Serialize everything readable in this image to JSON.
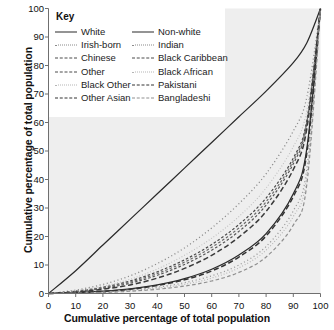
{
  "chart_data": {
    "type": "line",
    "title": "",
    "xlabel": "Cumulative percentage of total population",
    "ylabel": "Cumulative percentage of total population",
    "xlim": [
      0,
      100
    ],
    "ylim": [
      0,
      100
    ],
    "xticks": [
      0,
      10,
      20,
      30,
      40,
      50,
      60,
      70,
      80,
      90,
      100
    ],
    "yticks": [
      0,
      10,
      20,
      30,
      40,
      50,
      60,
      70,
      80,
      90,
      100
    ],
    "grid": false,
    "legend_position": "top-left",
    "legend_title": "Key",
    "x": [
      0,
      10,
      20,
      30,
      40,
      50,
      60,
      70,
      80,
      90,
      95,
      100
    ],
    "series": [
      {
        "name": "White",
        "style": "solid",
        "color": "#2a2a2a",
        "values": [
          0,
          8,
          17,
          26,
          35,
          44,
          53,
          62,
          71,
          81,
          88,
          100
        ]
      },
      {
        "name": "Non-white",
        "style": "solid",
        "color": "#2a2a2a",
        "values": [
          0,
          0.3,
          0.8,
          1.6,
          3.0,
          5.2,
          8.5,
          13.5,
          21.0,
          35.0,
          51.0,
          100
        ]
      },
      {
        "name": "Irish-born",
        "style": "dotted",
        "color": "#8a8a8a",
        "values": [
          0,
          1.2,
          3.2,
          6.2,
          10.5,
          16.0,
          23.0,
          31.5,
          42.0,
          57.0,
          69.0,
          100
        ]
      },
      {
        "name": "Indian",
        "style": "dotted",
        "color": "#9a9a9a",
        "values": [
          0,
          0.2,
          0.6,
          1.2,
          2.2,
          3.8,
          6.2,
          10.0,
          16.5,
          29.0,
          44.0,
          100
        ]
      },
      {
        "name": "Chinese",
        "style": "dash-short",
        "color": "#4a4a4a",
        "values": [
          0,
          0.8,
          2.2,
          4.4,
          7.6,
          11.8,
          17.2,
          24.2,
          33.5,
          47.5,
          61.0,
          100
        ]
      },
      {
        "name": "Black Caribbean",
        "style": "dash-short",
        "color": "#555555",
        "values": [
          0,
          0.6,
          1.8,
          3.6,
          6.4,
          10.2,
          15.2,
          21.8,
          31.0,
          45.5,
          59.5,
          100
        ]
      },
      {
        "name": "Other",
        "style": "dash-short",
        "color": "#6a6a6a",
        "values": [
          0,
          0.7,
          2.0,
          4.0,
          7.0,
          11.0,
          16.2,
          23.0,
          32.2,
          46.5,
          60.2,
          100
        ]
      },
      {
        "name": "Black African",
        "style": "fine-dot",
        "color": "#b0b0b0",
        "values": [
          0,
          0.15,
          0.5,
          1.0,
          1.9,
          3.2,
          5.4,
          9.0,
          15.2,
          27.0,
          41.5,
          100
        ]
      },
      {
        "name": "Black Other",
        "style": "fine-dot",
        "color": "#bdbdbd",
        "values": [
          0,
          0.9,
          2.6,
          5.0,
          8.6,
          13.4,
          19.4,
          27.0,
          37.0,
          51.5,
          64.5,
          100
        ]
      },
      {
        "name": "Pakistani",
        "style": "dash-long",
        "color": "#333333",
        "values": [
          0,
          0.25,
          0.7,
          1.5,
          2.8,
          4.8,
          7.9,
          12.8,
          20.2,
          34.0,
          49.5,
          100
        ]
      },
      {
        "name": "Other Asian",
        "style": "dash-long",
        "color": "#3a3a3a",
        "values": [
          0,
          0.5,
          1.5,
          3.0,
          5.4,
          8.8,
          13.4,
          19.8,
          28.8,
          43.5,
          58.0,
          100
        ]
      },
      {
        "name": "Bangladeshi",
        "style": "dash-med",
        "color": "#8f8f8f",
        "values": [
          0,
          0.1,
          0.35,
          0.8,
          1.5,
          2.6,
          4.4,
          7.4,
          12.8,
          24.0,
          38.5,
          100
        ]
      }
    ]
  },
  "legend": {
    "title": "Key",
    "col1": [
      {
        "label": "White",
        "key": "lk-solid"
      },
      {
        "label": "Irish-born",
        "key": "lk-dot"
      },
      {
        "label": "Chinese",
        "key": "lk-dash-s"
      },
      {
        "label": "Other",
        "key": "lk-dash-s"
      },
      {
        "label": "Black Other",
        "key": "lk-fine"
      },
      {
        "label": "Other Asian",
        "key": "lk-dash-l"
      }
    ],
    "col2": [
      {
        "label": "Non-white",
        "key": "lk-solid"
      },
      {
        "label": "Indian",
        "key": "lk-dot"
      },
      {
        "label": "Black Caribbean",
        "key": "lk-dash-s"
      },
      {
        "label": "Black African",
        "key": "lk-fine"
      },
      {
        "label": "Pakistani",
        "key": "lk-dash-l"
      },
      {
        "label": "Bangladeshi",
        "key": "lk-dash-m"
      }
    ]
  },
  "axes": {
    "x_title": "Cumulative percentage of total population",
    "y_title": "Cumulative percentage of total population"
  },
  "colors": {
    "plot_background": "#eeeeee",
    "axis": "#6f6f6f",
    "text": "#111111"
  }
}
